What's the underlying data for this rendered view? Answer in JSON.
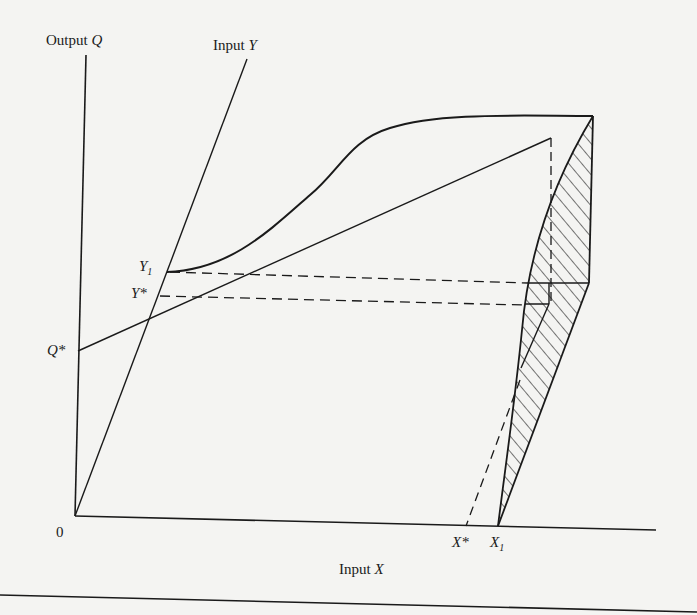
{
  "diagram": {
    "type": "production-function-3d",
    "axes": {
      "q_axis_label": "Output",
      "q_axis_var": "Q",
      "y_axis_label": "Input",
      "y_axis_var": "Y",
      "x_axis_label": "Input",
      "x_axis_var": "X",
      "origin_label": "0"
    },
    "points": {
      "y1_label": "Y",
      "y1_sub": "1",
      "ystar_label": "Y*",
      "qstar_label": "Q*",
      "xstar_label": "X*",
      "x1_label": "X",
      "x1_sub": "1"
    },
    "colors": {
      "ink": "#1a1a1a",
      "paper": "#f4f4f2"
    }
  }
}
